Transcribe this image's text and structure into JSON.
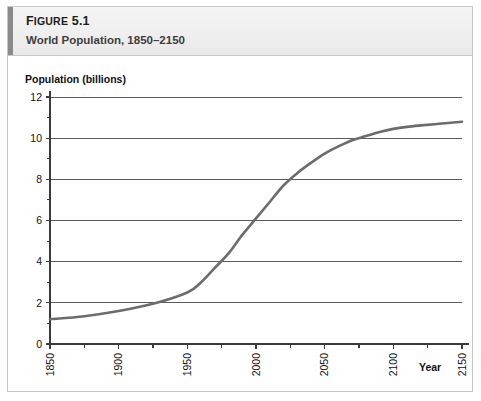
{
  "figure": {
    "number_prefix": "F",
    "number_rest": "IGURE",
    "number_value": " 5.1",
    "number_full": "Figure 5.1",
    "title": "World Population, 1850–2150"
  },
  "colors": {
    "accent_bar": "#8a8a8a",
    "header_bg": "#efefef",
    "border": "#c8c8c8",
    "curve": "#6b6b70",
    "gridline": "#5a5a5a",
    "axis": "#3a3a3a",
    "text": "#111111"
  },
  "chart_data": {
    "type": "line",
    "title": "World Population, 1850–2150",
    "xlabel": "Year",
    "ylabel": "Population (billions)",
    "xlim": [
      1850,
      2150
    ],
    "ylim": [
      0,
      12
    ],
    "xticks": [
      1850,
      1900,
      1950,
      2000,
      2050,
      2100,
      2150
    ],
    "xtick_labels": [
      "1850",
      "1900",
      "1950",
      "2000",
      "2050",
      "2100",
      "2150"
    ],
    "yticks": [
      0,
      2,
      4,
      6,
      8,
      10,
      12
    ],
    "ytick_labels": [
      "0",
      "2",
      "4",
      "6",
      "8",
      "10",
      "12"
    ],
    "yminor_ticks": [
      1,
      3,
      5,
      7,
      9,
      11
    ],
    "grid": "horizontal",
    "legend": "none",
    "series": [
      {
        "name": "World population",
        "x": [
          1850,
          1875,
          1900,
          1925,
          1950,
          1960,
          1970,
          1980,
          1990,
          2000,
          2010,
          2020,
          2030,
          2040,
          2050,
          2060,
          2070,
          2080,
          2090,
          2100,
          2110,
          2120,
          2130,
          2140,
          2150
        ],
        "values": [
          1.2,
          1.35,
          1.6,
          1.95,
          2.5,
          3.0,
          3.7,
          4.4,
          5.3,
          6.1,
          6.9,
          7.7,
          8.3,
          8.8,
          9.25,
          9.6,
          9.9,
          10.1,
          10.3,
          10.45,
          10.55,
          10.62,
          10.68,
          10.74,
          10.8
        ]
      }
    ]
  }
}
